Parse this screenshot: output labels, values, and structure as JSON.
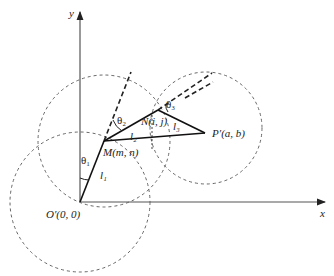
{
  "figure": {
    "type": "planar three-link arm geometry",
    "axes": {
      "x_label": "x",
      "y_label": "y",
      "origin_label": "O′(0, 0)"
    },
    "points": {
      "origin": {
        "label": "O′(0, 0)",
        "px": [
          80,
          202
        ]
      },
      "M": {
        "label": "M(m, n)",
        "px": [
          104,
          141
        ]
      },
      "N": {
        "label": "N(i, j)",
        "px": [
          158,
          110
        ]
      },
      "P": {
        "label": "P′(a, b)",
        "px": [
          205,
          133
        ]
      }
    },
    "links": [
      {
        "name": "l1",
        "label": "l₁",
        "from": "origin",
        "to": "M"
      },
      {
        "name": "l2",
        "label": "l₂",
        "from": "M",
        "to": "N"
      },
      {
        "name": "l3",
        "label": "l₃",
        "from": "N",
        "to": "P"
      }
    ],
    "angles": [
      {
        "name": "theta1",
        "label": "θ₁"
      },
      {
        "name": "theta2",
        "label": "θ₂"
      },
      {
        "name": "theta3",
        "label": "θ₃"
      }
    ],
    "workspace_circles": [
      {
        "center": "origin",
        "style": "dashed"
      },
      {
        "center": "M",
        "style": "dashed"
      },
      {
        "center": "P",
        "style": "dashed"
      }
    ]
  }
}
